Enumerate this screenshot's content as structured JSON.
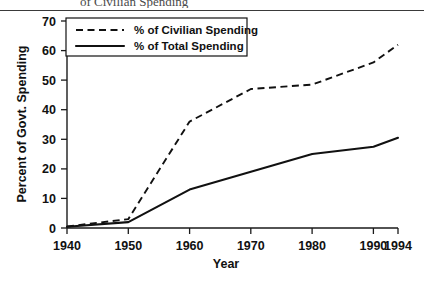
{
  "figure": {
    "top_rule_visible": true,
    "partial_cropped_caption": "of Civilian Spending"
  },
  "chart_data": {
    "type": "line",
    "title": "",
    "xlabel": "Year",
    "ylabel": "Percent of Govt. Spending",
    "x": [
      1940,
      1950,
      1960,
      1970,
      1980,
      1990,
      1994
    ],
    "xtick_labels": [
      "1940",
      "1950",
      "1960",
      "1970",
      "1980",
      "1990",
      "1994"
    ],
    "ytick_labels": [
      "0",
      "10",
      "20",
      "30",
      "40",
      "50",
      "60",
      "70"
    ],
    "yticks": [
      0,
      10,
      20,
      30,
      40,
      50,
      60,
      70
    ],
    "xlim": [
      1940,
      1994
    ],
    "ylim": [
      0,
      70
    ],
    "grid": false,
    "legend_position": "upper-left-inside",
    "series": [
      {
        "name": "% of Civilian Spending",
        "style": "dashed",
        "color": "#111111",
        "values": [
          0.5,
          3,
          36,
          47,
          48.5,
          56,
          62
        ]
      },
      {
        "name": "% of Total Spending",
        "style": "solid",
        "color": "#111111",
        "values": [
          0.4,
          2,
          13,
          19,
          25,
          27.5,
          30.5
        ]
      }
    ]
  }
}
